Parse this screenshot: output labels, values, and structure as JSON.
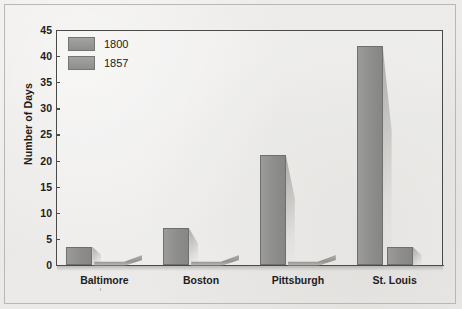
{
  "chart_data": {
    "type": "bar",
    "title": "",
    "xlabel": "",
    "ylabel": "Number of Days",
    "categories": [
      "Baltimore",
      "Boston",
      "Pittsburgh",
      "St. Louis"
    ],
    "series": [
      {
        "name": "1800",
        "values": [
          3.5,
          7,
          21,
          42
        ]
      },
      {
        "name": "1857",
        "values": [
          0,
          0,
          0,
          3.5
        ]
      }
    ],
    "ylim": [
      0,
      45
    ],
    "yticks": [
      0,
      5,
      10,
      15,
      20,
      25,
      30,
      35,
      40,
      45
    ],
    "ytick_labels": [
      "0",
      "5",
      "10",
      "15",
      "20",
      "25",
      "30",
      "35",
      "40",
      "45"
    ],
    "grid": false,
    "legend_position": "top-left",
    "style": "3d-column",
    "bar_color": "#8d8d8b"
  },
  "legend": {
    "entries": [
      {
        "label": "1800"
      },
      {
        "label": "1857"
      }
    ]
  },
  "axis": {
    "y_title": "Number of Days"
  }
}
